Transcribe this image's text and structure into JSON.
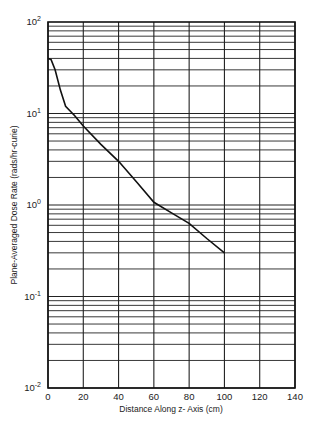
{
  "chart_data": {
    "type": "line",
    "title": "",
    "xlabel": "Distance Along z- Axis (cm)",
    "ylabel": "Plane-Averaged Dose Rate (rads/hr-curie)",
    "xlim": [
      0,
      140
    ],
    "ylim": [
      0.01,
      100
    ],
    "yscale": "log",
    "grid": true,
    "legend": null,
    "x_ticks": [
      0,
      20,
      40,
      60,
      80,
      100,
      120,
      140
    ],
    "x_tick_labels": [
      "0",
      "20",
      "40",
      "60",
      "80",
      "100",
      "120",
      "140"
    ],
    "y_ticks": [
      0.01,
      0.1,
      1,
      10,
      100
    ],
    "y_tick_labels": [
      {
        "base": "10",
        "exp": "-2"
      },
      {
        "base": "10",
        "exp": "-1"
      },
      {
        "base": "10",
        "exp": "0"
      },
      {
        "base": "10",
        "exp": "1"
      },
      {
        "base": "10",
        "exp": "2"
      }
    ],
    "series": [
      {
        "name": "Plane-averaged dose rate",
        "x": [
          0,
          1.7,
          4,
          7,
          10,
          15,
          20,
          30,
          40,
          50,
          60,
          70,
          80,
          90,
          100
        ],
        "y": [
          40,
          39,
          30,
          18,
          12,
          9.5,
          7.3,
          4.6,
          3.0,
          1.8,
          1.07,
          0.82,
          0.63,
          0.43,
          0.3
        ]
      }
    ]
  },
  "colors": {
    "line": "#111111",
    "grid": "#222222",
    "background": "#ffffff"
  }
}
